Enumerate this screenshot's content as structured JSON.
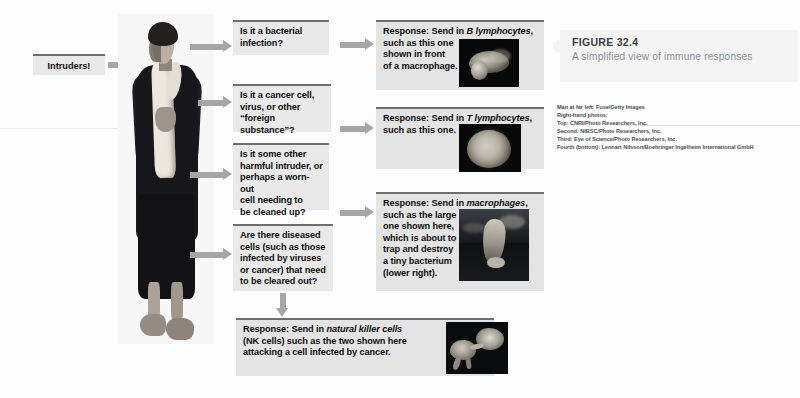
{
  "figure": {
    "number": "FIGURE 32.4",
    "subtitle": "A simplified view of immune responses"
  },
  "start": {
    "label": "Intruders!"
  },
  "questions": [
    {
      "id": "q1",
      "text": "Is it a bacterial\ninfection?"
    },
    {
      "id": "q2",
      "text": "Is it a cancer cell,\nvirus, or other\n“foreign substance”?"
    },
    {
      "id": "q3",
      "text": "Is it some other\nharmful intruder, or\nperhaps a worn-out\ncell needing to\nbe cleaned up?"
    },
    {
      "id": "q4",
      "text": "Are there diseased\ncells (such as those\ninfected by viruses\nor cancer) that need\nto be cleared out?"
    }
  ],
  "responses": [
    {
      "id": "r1",
      "lead": "Response: Send in ",
      "emphasis": "B lymphocytes",
      "tail": ",\nsuch as this one\nshown in front\nof a macrophage.",
      "photo": "b-lymphocyte-micrograph"
    },
    {
      "id": "r2",
      "lead": "Response: Send in ",
      "emphasis": "T lymphocytes",
      "tail": ",\nsuch as this one.",
      "photo": "t-lymphocyte-micrograph"
    },
    {
      "id": "r3",
      "lead": "Response: Send in ",
      "emphasis": "macrophages",
      "tail": ",\nsuch as the large\none shown here,\nwhich is about to\ntrap and destroy\na tiny bacterium\n(lower right).",
      "photo": "macrophage-micrograph"
    },
    {
      "id": "r4",
      "lead": "Response: Send in ",
      "emphasis": "natural killer cells",
      "tail": "\n(NK cells) such as the two shown here\nattacking a cell infected by cancer.",
      "photo": "natural-killer-cell-micrograph"
    }
  ],
  "photo_man": {
    "name": "man-photo"
  },
  "credits": [
    "Man at far left: Fuse/Getty Images",
    "Right-hand photos:",
    "Top: CNRI/Photo Researchers, Inc.",
    "Second: NIBSC/Photo Researchers, Inc.",
    "Third: Eye of Science/Photo Researchers, Inc.",
    "Fourth (bottom): Lennart Nilsson/Boehringer Ingelheim International GmbH"
  ],
  "colors": {
    "box_fill": "#e9e9e9",
    "box_rule": "#6e6e6e",
    "arrow": "#a6a6a6",
    "caption_heading": "#3b4046",
    "caption_subtitle": "#8c9199",
    "photo_bg": "#080809"
  }
}
